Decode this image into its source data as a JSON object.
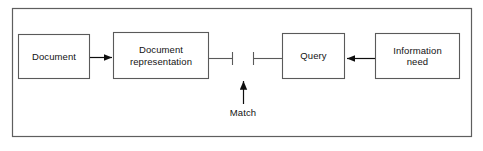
{
  "figure": {
    "kind": "block-diagram",
    "background_color": "#ffffff",
    "stroke_color": "#4a4a4a",
    "box_stroke_color": "#5a5a5a",
    "arrow_color": "#0e0e0e",
    "text_color": "#131313",
    "frame": {
      "name": "outer-frame",
      "x": 12,
      "y": 8,
      "width": 460,
      "height": 129
    }
  },
  "nodes": [
    {
      "id": "document",
      "label": "Document",
      "x": 18,
      "y": 34,
      "width": 72,
      "height": 45
    },
    {
      "id": "document-representation",
      "label": "Document\nrepresentation",
      "x": 113,
      "y": 32,
      "width": 96,
      "height": 47
    },
    {
      "id": "query",
      "label": "Query",
      "x": 282,
      "y": 33,
      "width": 63,
      "height": 46
    },
    {
      "id": "information-need",
      "label": "Information\nneed",
      "x": 375,
      "y": 33,
      "width": 85,
      "height": 46
    }
  ],
  "connectors": [
    {
      "id": "document-to-representation",
      "type": "arrow",
      "direction": "right",
      "from": "document",
      "to": "document-representation",
      "x1": 90,
      "x2": 113,
      "y": 57
    },
    {
      "id": "representation-to-match",
      "type": "line-terminator",
      "from": "document-representation",
      "to": "match-point",
      "x1": 209,
      "x2": 233,
      "y": 58,
      "terminator_height": 13
    },
    {
      "id": "match-to-query",
      "type": "line-terminator",
      "from": "match-point",
      "to": "query",
      "x1": 253,
      "x2": 282,
      "y": 58,
      "terminator_height": 13
    },
    {
      "id": "information-need-to-query",
      "type": "arrow",
      "direction": "left",
      "from": "information-need",
      "to": "query",
      "x1": 375,
      "x2": 345,
      "y": 58
    },
    {
      "id": "match-pointer",
      "type": "arrow",
      "direction": "up",
      "to": "match-point",
      "x": 243,
      "y1": 104,
      "y2": 80
    }
  ],
  "annotations": [
    {
      "id": "match-caption",
      "label": "Match",
      "x": 243,
      "y": 112
    }
  ]
}
